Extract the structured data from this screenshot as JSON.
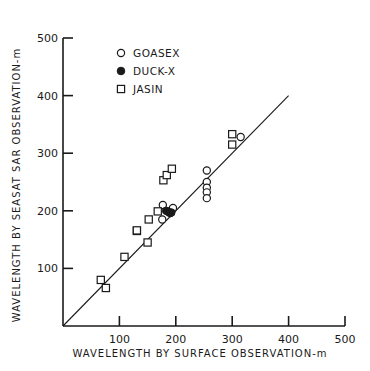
{
  "chart_data": {
    "type": "scatter",
    "title": "",
    "xlabel": "WAVELENGTH BY SURFACE OBSERVATION-m",
    "ylabel": "WAVELENGTH BY SEASAT SAR OBSERVATION-m",
    "xlim": [
      0,
      500
    ],
    "ylim": [
      0,
      500
    ],
    "x_ticks": [
      100,
      200,
      300,
      400,
      500
    ],
    "y_ticks": [
      100,
      200,
      300,
      400,
      500
    ],
    "grid": false,
    "legend_position": "upper-left",
    "reference_line": {
      "label": "1:1",
      "from": [
        0,
        0
      ],
      "to": [
        400,
        400
      ]
    },
    "series": [
      {
        "name": "GOASEX",
        "marker": "open-circle",
        "points": [
          [
            177,
            210
          ],
          [
            176,
            185
          ],
          [
            195,
            205
          ],
          [
            255,
            270
          ],
          [
            255,
            250
          ],
          [
            255,
            240
          ],
          [
            255,
            232
          ],
          [
            255,
            222
          ],
          [
            315,
            328
          ]
        ]
      },
      {
        "name": "DUCK-X",
        "marker": "filled-circle",
        "points": [
          [
            183,
            200
          ],
          [
            187,
            198
          ],
          [
            190,
            196
          ],
          [
            192,
            197
          ]
        ]
      },
      {
        "name": "JASIN",
        "marker": "open-square",
        "points": [
          [
            67,
            80
          ],
          [
            76,
            66
          ],
          [
            109,
            120
          ],
          [
            150,
            145
          ],
          [
            131,
            165
          ],
          [
            131,
            166
          ],
          [
            152,
            185
          ],
          [
            168,
            199
          ],
          [
            178,
            253
          ],
          [
            184,
            262
          ],
          [
            193,
            273
          ],
          [
            300,
            333
          ],
          [
            300,
            315
          ]
        ]
      }
    ]
  },
  "legend": {
    "items": [
      {
        "label": "GOASEX"
      },
      {
        "label": "DUCK-X"
      },
      {
        "label": "JASIN"
      }
    ]
  },
  "axes": {
    "x_tick_labels": [
      "100",
      "200",
      "300",
      "400",
      "500"
    ],
    "y_tick_labels": [
      "100",
      "200",
      "300",
      "400",
      "500"
    ]
  }
}
